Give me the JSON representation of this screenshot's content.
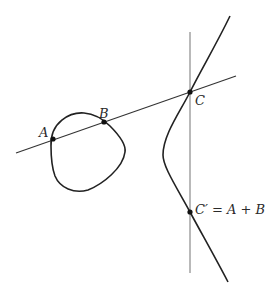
{
  "diagram": {
    "colors": {
      "curve": "#222222",
      "secant_line": "#333333",
      "vertical_line": "#8a8a8a",
      "points": "#111111",
      "labels": "#2a2a2a"
    },
    "points": [
      {
        "id": "A",
        "label": "A",
        "x": 53,
        "y": 139
      },
      {
        "id": "B",
        "label": "B",
        "x": 104,
        "y": 122
      },
      {
        "id": "C",
        "label": "C",
        "x": 190,
        "y": 92
      },
      {
        "id": "C_prime",
        "label": "C′ = A + B",
        "x": 190,
        "y": 212
      }
    ],
    "lines": {
      "secant": {
        "x1": 16,
        "y1": 153,
        "x2": 236,
        "y2": 76
      },
      "vertical": {
        "x1": 190,
        "y1": 32,
        "x2": 190,
        "y2": 273
      }
    },
    "labels": {
      "A": "A",
      "B": "B",
      "C": "C",
      "C_prime": "C′ = A + B"
    }
  }
}
